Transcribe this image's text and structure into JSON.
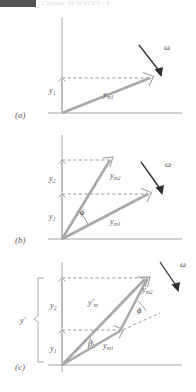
{
  "header": {
    "running_head": "Chapter 16    WAVES—I",
    "block_color": "#555555"
  },
  "figure": {
    "caption_labels": {
      "panel_a": "(a)",
      "panel_b": "(b)",
      "panel_c": "(c)"
    },
    "colors": {
      "phasor": "#a8a8a8",
      "axis": "#9a9a9a",
      "dashed": "#8e8e8e",
      "omega": "#2e2e2e",
      "text": "#5a5a5a"
    },
    "panels": [
      {
        "id": "a",
        "label": "(a)",
        "omega_symbol": "ω",
        "phasors": [
          {
            "name": "ym1",
            "base": "y",
            "sub": "m1",
            "label_text": "y",
            "sub_text": "m1",
            "angle_deg": 24,
            "length_px": 78
          }
        ],
        "components": [
          {
            "name": "y1",
            "base": "y",
            "sub": "1",
            "label_text": "y",
            "sub_text": "1"
          }
        ],
        "angles": []
      },
      {
        "id": "b",
        "label": "(b)",
        "omega_symbol": "ω",
        "phasors": [
          {
            "name": "ym1",
            "base": "y",
            "sub": "m1",
            "label_text": "y",
            "sub_text": "m1",
            "angle_deg": 24,
            "length_px": 78
          },
          {
            "name": "ym2",
            "base": "y",
            "sub": "m2",
            "label_text": "y",
            "sub_text": "m2",
            "angle_deg": 63,
            "length_px": 68
          }
        ],
        "components": [
          {
            "name": "y1",
            "base": "y",
            "sub": "1",
            "label_text": "y",
            "sub_text": "1"
          },
          {
            "name": "y2",
            "base": "y",
            "sub": "2",
            "label_text": "y",
            "sub_text": "2"
          }
        ],
        "angles": [
          {
            "name": "phi",
            "symbol": "ϕ",
            "between": [
              "ym1",
              "ym2"
            ]
          }
        ]
      },
      {
        "id": "c",
        "label": "(c)",
        "omega_symbol": "ω",
        "phasors": [
          {
            "name": "ym1",
            "base": "y",
            "sub": "m1",
            "label_text": "y",
            "sub_text": "m1",
            "angle_deg": 24,
            "length_px": 78
          },
          {
            "name": "ym2",
            "base": "y",
            "sub": "m2",
            "label_text": "y",
            "sub_text": "m2",
            "angle_deg": 50,
            "length_px": 125
          },
          {
            "name": "ym_prime",
            "base": "y′",
            "sub": "m",
            "label_text": "y",
            "sub_text": "m",
            "prime": "′"
          }
        ],
        "components": [
          {
            "name": "y1",
            "base": "y",
            "sub": "1",
            "label_text": "y",
            "sub_text": "1"
          },
          {
            "name": "y2",
            "base": "y",
            "sub": "2",
            "label_text": "y",
            "sub_text": "2"
          },
          {
            "name": "y_prime",
            "base": "y′",
            "sub": "",
            "label_text": "y",
            "prime": "′"
          }
        ],
        "angles": [
          {
            "name": "beta",
            "symbol": "β",
            "between": [
              "ym_prime",
              "ym1"
            ]
          },
          {
            "name": "phi",
            "symbol": "ϕ",
            "between": [
              "ym1_extended",
              "ym2"
            ]
          }
        ]
      }
    ]
  }
}
